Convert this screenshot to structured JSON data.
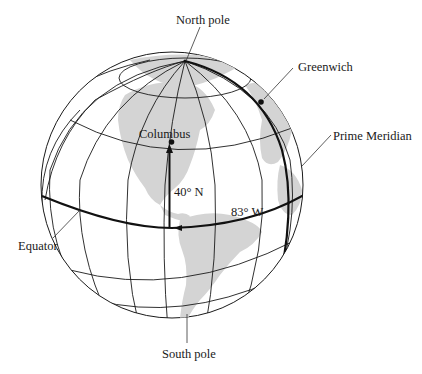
{
  "figure": {
    "type": "globe-latitude-longitude-diagram",
    "labels": {
      "north_pole": "North pole",
      "south_pole": "South pole",
      "greenwich": "Greenwich",
      "prime_meridian": "Prime Meridian",
      "equator": "Equator",
      "columbus": "Columbus",
      "latitude": "40° N",
      "longitude": "83° W"
    },
    "colors": {
      "background": "#ffffff",
      "land": "#d4d4d4",
      "lines": "#1a1a1a"
    }
  }
}
